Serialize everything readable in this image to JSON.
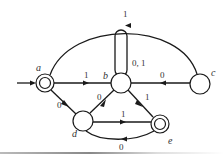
{
  "diagram": {
    "type": "finite-automaton",
    "nodes": [
      {
        "id": "a",
        "label": "a",
        "x": 45,
        "y": 83,
        "accepting": true,
        "initial": true
      },
      {
        "id": "b",
        "label": "b",
        "x": 121,
        "y": 83,
        "accepting": false
      },
      {
        "id": "c",
        "label": "c",
        "x": 200,
        "y": 84,
        "accepting": false
      },
      {
        "id": "d",
        "label": "d",
        "x": 83,
        "y": 121,
        "accepting": false
      },
      {
        "id": "e",
        "label": "e",
        "x": 160,
        "y": 124,
        "accepting": true
      }
    ],
    "edges": [
      {
        "from": "a",
        "to": "b",
        "label": "1"
      },
      {
        "from": "a",
        "to": "d",
        "label": "0"
      },
      {
        "from": "b",
        "to": "b",
        "label": "0, 1"
      },
      {
        "from": "c",
        "to": "b",
        "label": "0"
      },
      {
        "from": "c",
        "to": "a",
        "label": "1"
      },
      {
        "from": "d",
        "to": "b",
        "label": "0"
      },
      {
        "from": "b",
        "to": "e",
        "label": "1"
      },
      {
        "from": "d",
        "to": "e",
        "label": "1"
      },
      {
        "from": "e",
        "to": "d",
        "label": "0"
      }
    ]
  },
  "labels": {
    "a": "a",
    "b": "b",
    "c": "c",
    "d": "d",
    "e": "e",
    "ab": "1",
    "ad": "0",
    "bb": "0, 1",
    "cb": "0",
    "ca": "1",
    "db": "0",
    "be": "1",
    "de": "1",
    "ed": "0"
  }
}
